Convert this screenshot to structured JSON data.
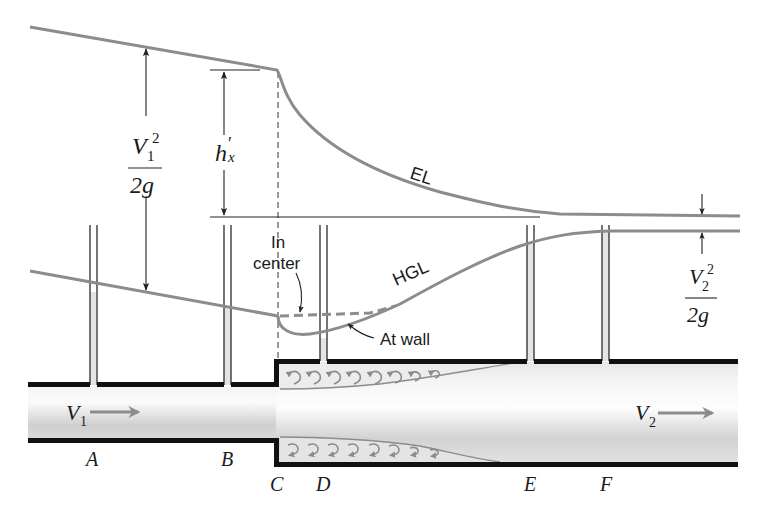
{
  "colors": {
    "line_gray": "#8c8c8c",
    "wall_black": "#111111",
    "fluid_gray": "#d0d0d0",
    "text": "#1a1a1a"
  },
  "labels": {
    "el": "EL",
    "hgl": "HGL",
    "in_center_1": "In",
    "in_center_2": "center",
    "at_wall": "At wall",
    "head_loss_h": "h",
    "head_loss_prime": "′",
    "head_loss_sub": "x",
    "v1_head": {
      "num_v": "V",
      "num_sub": "1",
      "num_sup": "2",
      "den": "2g"
    },
    "v2_head": {
      "num_v": "V",
      "num_sub": "2",
      "num_sup": "2",
      "den": "2g"
    },
    "v1_flow": {
      "v": "V",
      "sub": "1"
    },
    "v2_flow": {
      "v": "V",
      "sub": "2"
    }
  },
  "stations": [
    {
      "id": "A",
      "label": "A"
    },
    {
      "id": "B",
      "label": "B"
    },
    {
      "id": "C",
      "label": "C"
    },
    {
      "id": "D",
      "label": "D"
    },
    {
      "id": "E",
      "label": "E"
    },
    {
      "id": "F",
      "label": "F"
    }
  ]
}
